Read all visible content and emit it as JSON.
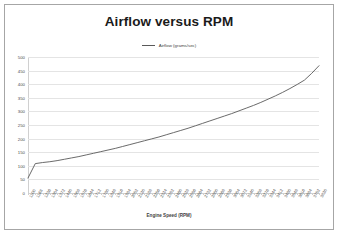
{
  "chart_data": {
    "type": "line",
    "title": "Airflow versus RPM",
    "xlabel": "Engine Speed (RPM)",
    "ylabel": "",
    "legend": [
      "Airflow (grams/sec)"
    ],
    "legend_position": "top-center",
    "grid": true,
    "ylim": [
      0,
      500
    ],
    "yticks": [
      0,
      50,
      100,
      150,
      200,
      250,
      300,
      350,
      400,
      450,
      500
    ],
    "ytick_labels": [
      "0",
      "50",
      "100",
      "150",
      "200",
      "250",
      "300",
      "350",
      "400",
      "450",
      "500"
    ],
    "line_color": "#595959",
    "categories": [
      "1100",
      "1168",
      "1236",
      "1304",
      "1372",
      "1440",
      "1508",
      "1576",
      "1644",
      "1712",
      "1780",
      "1848",
      "1916",
      "1984",
      "2052",
      "2120",
      "2188",
      "2256",
      "2324",
      "2392",
      "2460",
      "2528",
      "2596",
      "2664",
      "2732",
      "2800",
      "2868",
      "2936",
      "3004",
      "3072",
      "3140",
      "3208",
      "3276",
      "3344",
      "3412",
      "3480",
      "3548",
      "3616",
      "3684",
      "3752",
      "3820"
    ],
    "series": [
      {
        "name": "Airflow (grams/sec)",
        "values": [
          55,
          108,
          112,
          115,
          119,
          124,
          129,
          134,
          140,
          146,
          152,
          158,
          164,
          171,
          178,
          185,
          192,
          199,
          206,
          214,
          222,
          230,
          238,
          247,
          256,
          265,
          274,
          283,
          292,
          302,
          312,
          322,
          333,
          345,
          357,
          370,
          384,
          399,
          415,
          440,
          468
        ]
      }
    ]
  }
}
